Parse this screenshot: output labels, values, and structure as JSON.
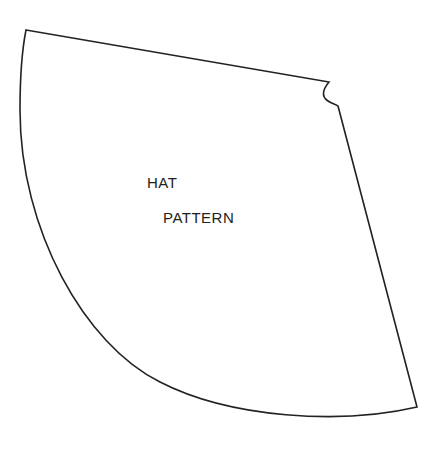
{
  "diagram": {
    "type": "sewing-pattern",
    "shape": "cone-sector",
    "label_lines": [
      "HAT",
      "PATTERN"
    ],
    "stroke_color": "#222222",
    "background_color": "#ffffff"
  }
}
